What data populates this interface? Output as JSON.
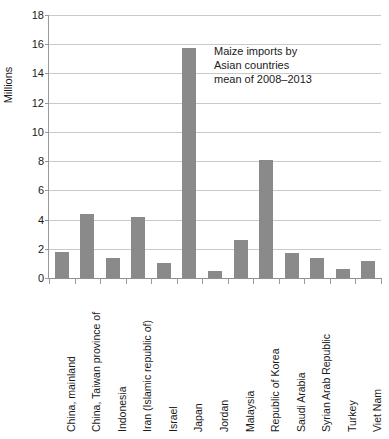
{
  "chart_data": {
    "type": "bar",
    "title": "",
    "annotation": "Maize imports by\nAsian countries\nmean of 2008–2013",
    "annotation_lines": [
      "Maize imports by",
      "Asian countries",
      "mean of 2008–2013"
    ],
    "xlabel": "",
    "ylabel": "Millions",
    "ylim": [
      0,
      18
    ],
    "ytick_step": 2,
    "yticks": [
      0,
      2,
      4,
      6,
      8,
      10,
      12,
      14,
      16,
      18
    ],
    "ytick_labels": [
      "0",
      "2",
      "4",
      "6",
      "8",
      "10",
      "12",
      "14",
      "16",
      "18"
    ],
    "grid": true,
    "legend": false,
    "legend_position": "none",
    "bar_color": "#8a8a8a",
    "gridline_color": "#c9c9c9",
    "axis_color": "#9a9a9a",
    "categories": [
      "China, mainland",
      "China, Taiwan province of",
      "Indonesia",
      "Iran (Islamic republic of)",
      "Israel",
      "Japan",
      "Jordan",
      "Malaysia",
      "Republic of Korea",
      "Saudi Arabia",
      "Syrian Arab Republic",
      "Turkey",
      "Viet Nam"
    ],
    "values": [
      1.75,
      4.4,
      1.4,
      4.15,
      1.05,
      15.75,
      0.5,
      2.6,
      8.1,
      1.7,
      1.4,
      0.6,
      1.15
    ]
  }
}
